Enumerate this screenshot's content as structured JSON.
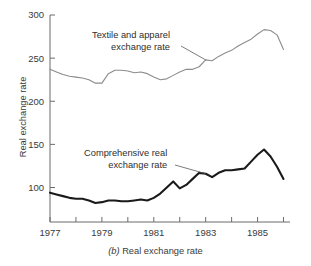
{
  "figure": {
    "caption_id": "(b)",
    "caption_text": "Real exchange rate",
    "ylabel": "Real exchange rate",
    "annotations": {
      "textile_line1": "Textile and apparel",
      "textile_line2": "exchange rate",
      "comprehensive_line1": "Comprehensive real",
      "comprehensive_line2": "exchange rate"
    },
    "colors": {
      "textile": "#8c8c8c",
      "comprehensive": "#1a1a1a",
      "axis": "#6b6b6b",
      "text": "#3a3a3a",
      "background": "#ffffff"
    }
  },
  "chart_data": {
    "type": "line",
    "title": "",
    "subtitle": "",
    "caption": "(b) Real exchange rate",
    "xlabel": "",
    "ylabel": "Real exchange rate",
    "xlim": [
      1977,
      1986.25
    ],
    "ylim": [
      60,
      300
    ],
    "grid": false,
    "legend": "annotations-inline",
    "yticks": [
      100,
      150,
      200,
      250,
      300
    ],
    "ytick_labels": [
      "100",
      "150",
      "200",
      "250",
      "300"
    ],
    "xticks": [
      1977,
      1978,
      1979,
      1980,
      1981,
      1982,
      1983,
      1984,
      1985,
      1986
    ],
    "xtick_labels": [
      "1977",
      "",
      "1979",
      "",
      "1981",
      "",
      "1983",
      "",
      "1985",
      ""
    ],
    "xtick_labeled": [
      1977,
      1979,
      1981,
      1983,
      1985
    ],
    "series": [
      {
        "name": "Textile and apparel exchange rate",
        "color": "#8c8c8c",
        "linewidth": 1.1,
        "x": [
          1977.0,
          1977.25,
          1977.5,
          1977.75,
          1978.0,
          1978.25,
          1978.5,
          1978.75,
          1979.0,
          1979.25,
          1979.5,
          1979.75,
          1980.0,
          1980.25,
          1980.5,
          1980.75,
          1981.0,
          1981.25,
          1981.5,
          1981.75,
          1982.0,
          1982.25,
          1982.5,
          1982.75,
          1983.0,
          1983.25,
          1983.5,
          1983.75,
          1984.0,
          1984.25,
          1984.5,
          1984.75,
          1985.0,
          1985.25,
          1985.5,
          1985.75,
          1986.0
        ],
        "values": [
          237,
          234,
          231,
          229,
          228,
          227,
          225,
          221,
          221,
          232,
          236,
          236,
          235,
          233,
          234,
          232,
          228,
          225,
          226,
          230,
          234,
          237,
          237,
          240,
          248,
          247,
          252,
          256,
          259,
          264,
          268,
          272,
          278,
          283,
          282,
          277,
          260
        ]
      },
      {
        "name": "Comprehensive real exchange rate",
        "color": "#1a1a1a",
        "linewidth": 2.1,
        "x": [
          1977.0,
          1977.25,
          1977.5,
          1977.75,
          1978.0,
          1978.25,
          1978.5,
          1978.75,
          1979.0,
          1979.25,
          1979.5,
          1979.75,
          1980.0,
          1980.25,
          1980.5,
          1980.75,
          1981.0,
          1981.25,
          1981.5,
          1981.75,
          1982.0,
          1982.25,
          1982.5,
          1982.75,
          1983.0,
          1983.25,
          1983.5,
          1983.75,
          1984.0,
          1984.25,
          1984.5,
          1984.75,
          1985.0,
          1985.25,
          1985.5,
          1985.75,
          1986.0
        ],
        "values": [
          94,
          92,
          90,
          88,
          87,
          87,
          85,
          82,
          83,
          85,
          85,
          84,
          84,
          85,
          86,
          85,
          88,
          93,
          100,
          107,
          99,
          103,
          110,
          117,
          116,
          112,
          117,
          120,
          120,
          121,
          122,
          130,
          138,
          144,
          136,
          124,
          110
        ]
      }
    ],
    "annotations": [
      {
        "text": "Textile and apparel exchange rate",
        "series": "Textile and apparel exchange rate",
        "points_to_x": 1983.0,
        "points_to_y": 248
      },
      {
        "text": "Comprehensive real exchange rate",
        "series": "Comprehensive real exchange rate",
        "points_to_x": 1983.0,
        "points_to_y": 116
      }
    ]
  }
}
